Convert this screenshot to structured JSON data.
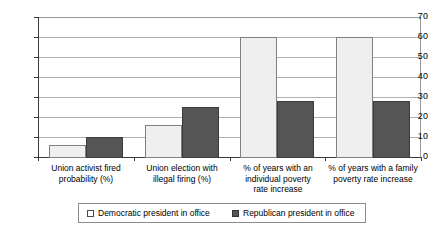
{
  "chart_data": {
    "type": "bar",
    "title": "",
    "subtitle": "",
    "xlabel": "",
    "ylabel": "",
    "ylim": [
      0,
      70
    ],
    "ytick_step": 10,
    "yticks": [
      "70",
      "60",
      "50",
      "40",
      "30",
      "20",
      "10",
      "0"
    ],
    "grid": true,
    "grid_axis": "y",
    "legend_position": "bottom",
    "categories": [
      "Union activist fired probability (%)",
      "Union election with illegal firing (%)",
      "% of years with an individual poverty rate increase",
      "% of years with a family poverty rate increase"
    ],
    "category_lines": [
      [
        "Union activist fired",
        "probability (%)"
      ],
      [
        "Union election with",
        "illegal firing (%)"
      ],
      [
        "% of years with an",
        "individual poverty",
        "rate increase"
      ],
      [
        "% of years with a family",
        "poverty rate increase"
      ]
    ],
    "series": [
      {
        "name": "Democratic president in office",
        "color": "#efefef",
        "border_color": "#808080",
        "values": [
          6,
          16,
          60,
          60
        ]
      },
      {
        "name": "Republican president in office",
        "color": "#555555",
        "border_color": "#3b3b3b",
        "values": [
          10,
          25,
          28,
          28
        ]
      }
    ]
  },
  "legend": {
    "items": [
      {
        "label": "Democratic president in office",
        "swatch": "legend-swatch-democratic"
      },
      {
        "label": "Republican president in office",
        "swatch": "legend-swatch-republican"
      }
    ]
  },
  "colors": {
    "democratic": "#efefef",
    "republican": "#555555",
    "gridline": "#b0b0b0",
    "axis": "#3a3a3a",
    "frame": "#9a9a9a",
    "background": "#ffffff"
  }
}
